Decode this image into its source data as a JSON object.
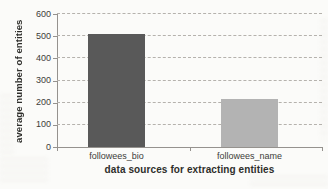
{
  "chart_data": {
    "type": "bar",
    "title": "",
    "categories": [
      "followees_bio",
      "followees_name"
    ],
    "values": [
      510,
      215
    ],
    "xlabel": "data sources for extracting entities",
    "ylabel": "average number of entities",
    "ylim": [
      0,
      600
    ],
    "yticks": [
      0,
      100,
      200,
      300,
      400,
      500,
      600
    ],
    "grid": "horizontal-dashed",
    "legend": "none",
    "bar_colors": [
      "#595959",
      "#b3b3b3"
    ]
  },
  "colors": {
    "background": "#fbfbf9",
    "axis": "#95928e",
    "gridline": "#b5b2ad",
    "text": "#3d3d3a"
  }
}
